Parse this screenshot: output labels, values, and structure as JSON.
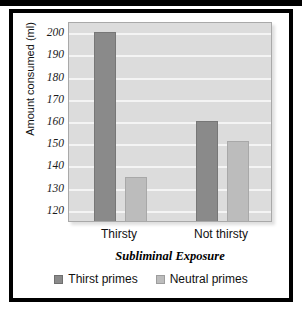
{
  "chart_data": {
    "type": "bar",
    "title": "",
    "subtitle": "",
    "xlabel": "Subliminal Exposure",
    "ylabel": "Amount consumed (ml)",
    "categories": [
      "Thirsty",
      "Not thirsty"
    ],
    "series": [
      {
        "name": "Thirst primes",
        "values": [
          200,
          160
        ],
        "color": "#8a8a8a"
      },
      {
        "name": "Neutral primes",
        "values": [
          135,
          151
        ],
        "color": "#bcbcbc"
      }
    ],
    "ylim": [
      115,
      205
    ],
    "yticks": [
      120,
      130,
      140,
      150,
      160,
      170,
      180,
      190,
      200
    ],
    "ytick_labels": [
      "120",
      "130",
      "140",
      "150",
      "160",
      "170",
      "180",
      "190",
      "200"
    ],
    "grid": true,
    "grid_color": "#f4f4f4",
    "plot_background": "#dcdcdc",
    "legend_position": "bottom"
  },
  "axes": {
    "y_title": "Amount consumed (ml)",
    "x_title": "Subliminal Exposure",
    "y_ticks": [
      "200",
      "190",
      "180",
      "170",
      "160",
      "150",
      "140",
      "130",
      "120"
    ],
    "x_ticks": [
      "Thirsty",
      "Not thirsty"
    ]
  },
  "legend": {
    "items": [
      {
        "label": "Thirst primes",
        "swatch": "dark-gray-swatch"
      },
      {
        "label": "Neutral primes",
        "swatch": "light-gray-swatch"
      }
    ]
  },
  "colors": {
    "thirst_primes": "#8a8a8a",
    "neutral_primes": "#bcbcbc",
    "plot_bg": "#dcdcdc",
    "gridline": "#f4f4f4",
    "frame": "#000000"
  }
}
